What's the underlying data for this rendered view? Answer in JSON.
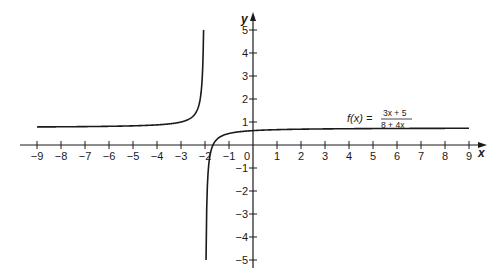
{
  "chart_data": {
    "type": "line",
    "title": "",
    "xlabel": "x",
    "ylabel": "y",
    "xlim": [
      -9,
      9
    ],
    "ylim": [
      -5,
      5
    ],
    "grid": false,
    "x_ticks": [
      -9,
      -8,
      -7,
      -6,
      -5,
      -4,
      -3,
      -2,
      -1,
      0,
      1,
      2,
      3,
      4,
      5,
      6,
      7,
      8,
      9
    ],
    "x_tick_labels": [
      "−9",
      "−8",
      "−7",
      "−6",
      "−5",
      "−4",
      "−3",
      "−2",
      "−1",
      "0",
      "1",
      "2",
      "3",
      "4",
      "5",
      "6",
      "7",
      "8",
      "9"
    ],
    "y_ticks": [
      -5,
      -4,
      -3,
      -2,
      -1,
      1,
      2,
      3,
      4,
      5
    ],
    "y_tick_labels": [
      "−5",
      "−4",
      "−3",
      "−2",
      "−1",
      "1",
      "2",
      "3",
      "4",
      "5"
    ],
    "series": [
      {
        "name": "f(x) = (3x + 5)/(8 + 4x)",
        "function": "(3*x+5)/(8+4*x)",
        "vertical_asymptote": -2,
        "horizontal_asymptote": 0.75,
        "x_intercept": -1.6667,
        "y_intercept": 0.625,
        "points": [
          {
            "x": -9,
            "y": 0.786
          },
          {
            "x": -8,
            "y": 0.792
          },
          {
            "x": -6,
            "y": 0.813
          },
          {
            "x": -4,
            "y": 0.875
          },
          {
            "x": -3,
            "y": 1.0
          },
          {
            "x": -2.5,
            "y": 1.25
          },
          {
            "x": -2.2,
            "y": 2.0
          },
          {
            "x": -2.05,
            "y": 5.0
          },
          {
            "x": -1.95,
            "y": -5.0
          },
          {
            "x": -1.8,
            "y": -0.5
          },
          {
            "x": -1.6667,
            "y": 0
          },
          {
            "x": -1,
            "y": 0.5
          },
          {
            "x": 0,
            "y": 0.625
          },
          {
            "x": 3,
            "y": 0.7
          },
          {
            "x": 6,
            "y": 0.719
          },
          {
            "x": 9,
            "y": 0.727
          }
        ]
      }
    ],
    "annotations": [
      {
        "text": "f(x) = (3x + 5)/(8 + 4x)",
        "x": 5,
        "y": 1.3
      }
    ],
    "legend": null
  },
  "labels": {
    "x_axis": "x",
    "y_axis": "y",
    "origin": "0",
    "fn_lhs": "f(x) =",
    "fn_num": "3x + 5",
    "fn_den": "8 + 4x"
  },
  "style": {
    "line_color": "#1a1a1a",
    "axis_color": "#1a1a1a",
    "background": "#ffffff"
  }
}
